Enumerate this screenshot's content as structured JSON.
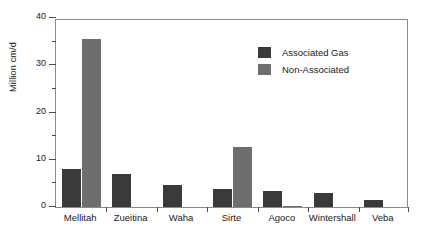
{
  "chart_data": {
    "type": "bar",
    "title": "",
    "subtitle": "",
    "xlabel": "",
    "ylabel": "Million cm/d",
    "ylim": [
      0,
      40
    ],
    "ytick_step": 10,
    "yticks": [
      0,
      10,
      20,
      30,
      40
    ],
    "ytick_labels": [
      "0",
      "10",
      "20",
      "30",
      "40"
    ],
    "yminor_step": 5,
    "grid": false,
    "legend_position": "upper right",
    "categories": [
      "Mellitah",
      "Zueitina",
      "Waha",
      "Sirte",
      "Agoco",
      "Wintershall",
      "Veba"
    ],
    "series": [
      {
        "name": "Associated Gas",
        "color": "#3a3a3a",
        "values": [
          8.1,
          7.0,
          4.7,
          3.8,
          3.4,
          2.9,
          1.4
        ]
      },
      {
        "name": "Non-Associated",
        "color": "#6e6e6e",
        "values": [
          35.5,
          0,
          0,
          12.7,
          0.2,
          0,
          0
        ]
      }
    ]
  },
  "colors": {
    "associated_gas": "#3a3a3a",
    "non_associated": "#6e6e6e",
    "axis": "#8a8a8a",
    "text": "#1a1a1a",
    "background": "#ffffff"
  }
}
